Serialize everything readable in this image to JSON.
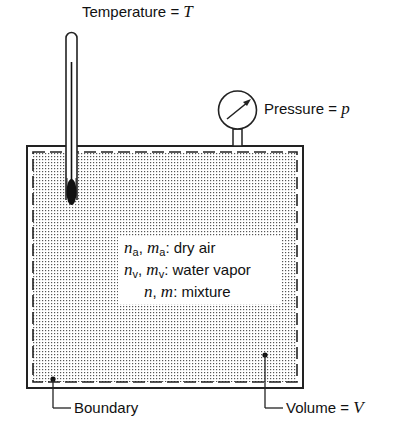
{
  "diagram": {
    "thermometer": {
      "label": "Temperature",
      "equals": "=",
      "symbol": "T"
    },
    "gauge": {
      "label": "Pressure",
      "equals": "=",
      "symbol": "p"
    },
    "legend": {
      "rows": [
        {
          "sym1": "n",
          "sub1": "a",
          "sym2": "m",
          "sub2": "a",
          "text": ": dry air"
        },
        {
          "sym1": "n",
          "sub1": "v",
          "sym2": "m",
          "sub2": "v",
          "text": ": water vapor"
        },
        {
          "sym1": "n",
          "sub1": "",
          "sym2": "m",
          "sub2": "",
          "text": ": mixture"
        }
      ]
    },
    "boundary": {
      "label": "Boundary"
    },
    "volume": {
      "label": "Volume",
      "equals": "=",
      "symbol": "V"
    }
  }
}
